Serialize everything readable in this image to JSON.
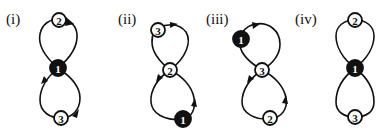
{
  "figure": {
    "panels": [
      {
        "label": "(i)",
        "nodes": [
          {
            "id": "2",
            "filled": false
          },
          {
            "id": "1",
            "filled": true
          },
          {
            "id": "3",
            "filled": false
          }
        ],
        "arrows": true
      },
      {
        "label": "(ii)",
        "nodes": [
          {
            "id": "3",
            "filled": false
          },
          {
            "id": "2",
            "filled": false
          },
          {
            "id": "1",
            "filled": true
          }
        ],
        "arrows": true
      },
      {
        "label": "(iii)",
        "nodes": [
          {
            "id": "1",
            "filled": true
          },
          {
            "id": "3",
            "filled": false
          },
          {
            "id": "2",
            "filled": false
          }
        ],
        "arrows": true
      },
      {
        "label": "(iv)",
        "nodes": [
          {
            "id": "2",
            "filled": false
          },
          {
            "id": "1",
            "filled": true
          },
          {
            "id": "3",
            "filled": false
          }
        ],
        "arrows": false
      }
    ]
  }
}
